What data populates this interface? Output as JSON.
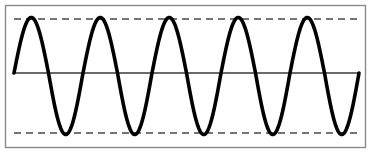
{
  "figure": {
    "width": 372,
    "height": 157,
    "background_color": "#ffffff",
    "frame": {
      "name": "plot-frame",
      "x": 5.5,
      "y": 5.5,
      "width": 360,
      "height": 142,
      "stroke_color": "#8a8a8a",
      "stroke_width": 1.4,
      "fill": "none"
    },
    "zero_axis": {
      "name": "zero-axis-line",
      "y": 73,
      "x_start": 14,
      "x_end": 359,
      "stroke_color": "#3a3a3a",
      "stroke_width": 1.6
    },
    "reference_lines": [
      {
        "label": "positive-peak-envelope",
        "y": 19,
        "x_start": 14,
        "x_end": 359,
        "stroke_color": "#757575",
        "stroke_width": 2.2,
        "dash": "7,5"
      },
      {
        "label": "negative-peak-envelope",
        "y": 133,
        "x_start": 14,
        "x_end": 359,
        "stroke_color": "#757575",
        "stroke_width": 2.2,
        "dash": "7,5"
      }
    ]
  },
  "chart_data": {
    "type": "line",
    "subtitle": "",
    "xlabel": "",
    "ylabel": "",
    "grid": false,
    "legend": null,
    "curve_color": "#000000",
    "curve_width": 3.6,
    "waveform": {
      "function": "sine",
      "amplitude": 1,
      "cycles": 5,
      "phase_deg": 0,
      "period_px": 68.8,
      "start_x_px": 14,
      "end_x_px": 359,
      "zero_y_px": 73,
      "peak_y_px": 17.5,
      "trough_y_px": 134.5
    },
    "x": [
      0,
      0.25,
      0.5,
      0.75,
      1,
      1.25,
      1.5,
      1.75,
      2,
      2.25,
      2.5,
      2.75,
      3,
      3.25,
      3.5,
      3.75,
      4,
      4.25,
      4.5,
      4.75,
      5
    ],
    "values": [
      0,
      1,
      0,
      -1,
      0,
      1,
      0,
      -1,
      0,
      1,
      0,
      -1,
      0,
      1,
      0,
      -1,
      0,
      1,
      0,
      -1,
      0
    ],
    "xlim": [
      0,
      5
    ],
    "ylim": [
      -1.15,
      1.15
    ],
    "peaks_x_px": [
      31.2,
      100,
      168.8,
      237.6,
      306.4
    ],
    "troughs_x_px": [
      65.6,
      134.4,
      203.2,
      272,
      340.8
    ],
    "annotations": [
      {
        "label": "positive peak level",
        "y_value": 1
      },
      {
        "label": "negative peak level",
        "y_value": -1
      },
      {
        "label": "zero reference",
        "y_value": 0
      }
    ]
  }
}
